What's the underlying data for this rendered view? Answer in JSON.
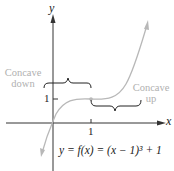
{
  "diagram": {
    "axes": {
      "x_label": "x",
      "y_label": "y"
    },
    "ticks": {
      "x_tick": "1",
      "y_tick": "1"
    },
    "annotations": {
      "left": {
        "line1": "Concave",
        "line2": "down"
      },
      "right": {
        "line1": "Concave",
        "line2": "up"
      }
    },
    "equation": "y = f(x) = (x − 1)³ + 1",
    "colors": {
      "curve": "#b8b8b8",
      "axes": "#333333",
      "labels_gray": "#b0b0b0"
    },
    "inflection_point": [
      1,
      1
    ]
  }
}
